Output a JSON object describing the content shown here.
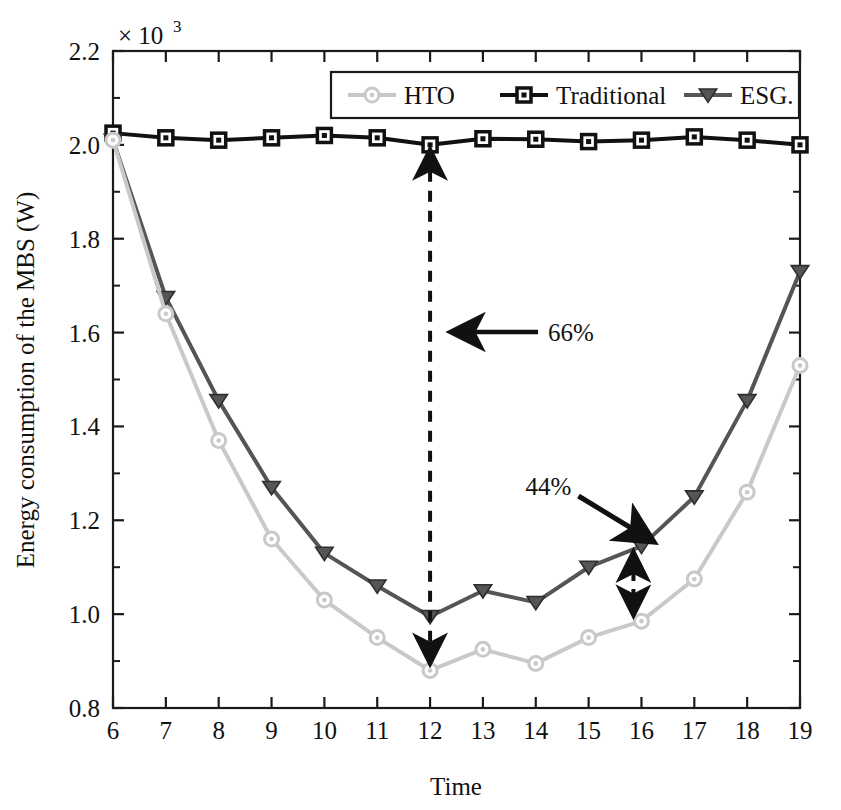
{
  "chart_data": {
    "type": "line",
    "title": "",
    "xlabel": "Time",
    "ylabel": "Energy consumption of the MBS (W)",
    "y_multiplier": "× 10",
    "y_multiplier_exponent": "3",
    "xlim": [
      6,
      19
    ],
    "ylim": [
      0.8,
      2.2
    ],
    "grid": false,
    "legend_position": "top-center-inside",
    "x": [
      6,
      7,
      8,
      9,
      10,
      11,
      12,
      13,
      14,
      15,
      16,
      17,
      18,
      19
    ],
    "x_tick_labels": [
      "6",
      "7",
      "8",
      "9",
      "10",
      "11",
      "12",
      "13",
      "14",
      "15",
      "16",
      "17",
      "18",
      "19"
    ],
    "y_tick_labels": [
      "0.8",
      "1.0",
      "1.2",
      "1.4",
      "1.6",
      "1.8",
      "2.0",
      "2.2"
    ],
    "y_ticks": [
      0.8,
      1.0,
      1.2,
      1.4,
      1.6,
      1.8,
      2.0,
      2.2
    ],
    "series": [
      {
        "name": "HTO",
        "color": "#c9c9c9",
        "marker": "circle",
        "values": [
          2.01,
          1.64,
          1.37,
          1.16,
          1.03,
          0.95,
          0.88,
          0.925,
          0.895,
          0.95,
          0.985,
          1.075,
          1.26,
          1.53
        ]
      },
      {
        "name": "Traditional",
        "color": "#111111",
        "marker": "square",
        "values": [
          2.025,
          2.015,
          2.01,
          2.015,
          2.02,
          2.015,
          2.0,
          2.013,
          2.012,
          2.007,
          2.01,
          2.017,
          2.01,
          2.0
        ]
      },
      {
        "name": "ESG.",
        "color": "#555555",
        "marker": "triangle-down",
        "values": [
          2.01,
          1.675,
          1.455,
          1.27,
          1.13,
          1.06,
          0.995,
          1.05,
          1.025,
          1.1,
          1.145,
          1.25,
          1.455,
          1.73
        ]
      }
    ],
    "annotations": [
      {
        "id": "annotation-66",
        "label": "66%",
        "x": 12,
        "y_from": 2.0,
        "y_to": 0.88,
        "style": "dashed-double-arrow-vertical",
        "arrow": "left-horizontal"
      },
      {
        "id": "annotation-44",
        "label": "44%",
        "x": 16,
        "y_from": 1.145,
        "y_to": 0.985,
        "style": "dashed-double-arrow-vertical",
        "arrow": "diagonal-down-right"
      }
    ]
  },
  "legend": {
    "entries": [
      {
        "label": "HTO",
        "color": "#c9c9c9",
        "marker": "circle"
      },
      {
        "label": "Traditional",
        "color": "#111111",
        "marker": "square"
      },
      {
        "label": "ESG.",
        "color": "#555555",
        "marker": "triangle-down"
      }
    ]
  },
  "colors": {
    "hto": "#c9c9c9",
    "traditional": "#111111",
    "esg": "#555555",
    "axis": "#1a1a1a",
    "background": "#ffffff"
  }
}
